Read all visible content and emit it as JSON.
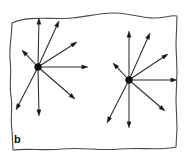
{
  "figure": {
    "label": "b",
    "label_position": {
      "x": 14,
      "y": 143
    },
    "width": 185,
    "height": 158,
    "background_color": "#ffffff",
    "frame": {
      "name": "hand-drawn-wavy-rectangle",
      "stroke_color": "#4a4a4a",
      "stroke_width": 1.1,
      "path": "M 12 23 C 30 15, 52 20, 72 18 C 92 16, 108 11, 126 14 C 140 16, 152 20, 165 17 C 170 16, 174 15, 177 16 L 176 44 L 177 72 L 176 100 L 177 128 L 176 147 C 160 151, 140 147, 120 149 C 100 151, 82 147, 62 149 C 44 151, 28 148, 13 150 L 12 130 C 10 118, 13 108, 11 96 C 9 84, 12 72, 10 60 C 9 48, 12 34, 12 23 Z"
    },
    "stars": [
      {
        "name": "vector-star-left",
        "center": {
          "x": 38,
          "y": 67
        },
        "node_radius": 3.4,
        "node_color": "#0d0d0d",
        "arrow_color": "#2b2b2b",
        "vector_count": 8,
        "vectors": [
          {
            "name": "vector-up",
            "tip": {
              "x": 39,
              "y": 18
            },
            "angle_deg": 91,
            "length": 49
          },
          {
            "name": "vector-upper-right-steep",
            "tip": {
              "x": 59,
              "y": 21
            },
            "angle_deg": 66,
            "length": 50
          },
          {
            "name": "vector-upper-right-shallow",
            "tip": {
              "x": 77,
              "y": 42
            },
            "angle_deg": 33,
            "length": 47
          },
          {
            "name": "vector-right",
            "tip": {
              "x": 88,
              "y": 67
            },
            "angle_deg": 0,
            "length": 50
          },
          {
            "name": "vector-lower-right",
            "tip": {
              "x": 75,
              "y": 99
            },
            "angle_deg": -41,
            "length": 49
          },
          {
            "name": "vector-down",
            "tip": {
              "x": 39,
              "y": 116
            },
            "angle_deg": -89,
            "length": 49
          },
          {
            "name": "vector-lower-left",
            "tip": {
              "x": 16,
              "y": 110
            },
            "angle_deg": -117,
            "length": 48
          },
          {
            "name": "vector-upper-left-short",
            "tip": {
              "x": 22,
              "y": 50
            },
            "angle_deg": 133,
            "length": 23
          }
        ]
      },
      {
        "name": "vector-star-right",
        "center": {
          "x": 129,
          "y": 80
        },
        "node_radius": 3.4,
        "node_color": "#0d0d0d",
        "arrow_color": "#2b2b2b",
        "vector_count": 8,
        "vectors": [
          {
            "name": "vector-up",
            "tip": {
              "x": 129,
              "y": 31
            },
            "angle_deg": 90,
            "length": 49
          },
          {
            "name": "vector-upper-right-steep",
            "tip": {
              "x": 150,
              "y": 33
            },
            "angle_deg": 66,
            "length": 51
          },
          {
            "name": "vector-upper-right-shallow",
            "tip": {
              "x": 168,
              "y": 54
            },
            "angle_deg": 34,
            "length": 47
          },
          {
            "name": "vector-right",
            "tip": {
              "x": 177,
              "y": 80
            },
            "angle_deg": 0,
            "length": 48
          },
          {
            "name": "vector-lower-right",
            "tip": {
              "x": 165,
              "y": 111
            },
            "angle_deg": -41,
            "length": 47
          },
          {
            "name": "vector-down",
            "tip": {
              "x": 129,
              "y": 128
            },
            "angle_deg": -90,
            "length": 48
          },
          {
            "name": "vector-lower-left",
            "tip": {
              "x": 107,
              "y": 123
            },
            "angle_deg": -117,
            "length": 48
          },
          {
            "name": "vector-upper-left-short",
            "tip": {
              "x": 113,
              "y": 63
            },
            "angle_deg": 133,
            "length": 23
          }
        ]
      }
    ]
  }
}
